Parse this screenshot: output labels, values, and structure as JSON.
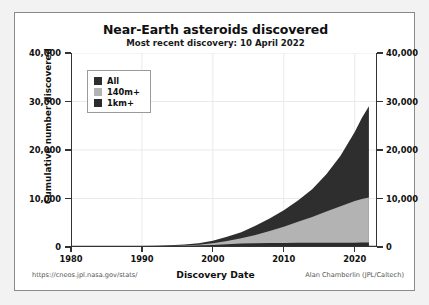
{
  "chart_data": {
    "type": "area",
    "title": "Near-Earth asteroids discovered",
    "subtitle": "Most recent discovery:  10 April 2022",
    "xlabel": "Discovery Date",
    "ylabel": "Cumulative number discovered",
    "xlim": [
      1980,
      2023
    ],
    "ylim": [
      0,
      40000
    ],
    "xticks": [
      "1980",
      "1990",
      "2000",
      "2010",
      "2020"
    ],
    "xtick_values": [
      1980,
      1990,
      2000,
      2010,
      2020
    ],
    "yticks": [
      "0",
      "10,000",
      "20,000",
      "30,000",
      "40,000"
    ],
    "ytick_values": [
      0,
      10000,
      20000,
      30000,
      40000
    ],
    "grid": true,
    "stacked": true,
    "legend_position": "upper left",
    "x": [
      1980,
      1982,
      1984,
      1986,
      1988,
      1990,
      1992,
      1994,
      1996,
      1998,
      2000,
      2002,
      2004,
      2006,
      2008,
      2010,
      2012,
      2014,
      2016,
      2018,
      2020,
      2021,
      2022
    ],
    "series": [
      {
        "name": "All",
        "color": "#2e2e2e",
        "values": [
          60,
          75,
          95,
          120,
          160,
          210,
          280,
          380,
          530,
          780,
          1300,
          2100,
          3050,
          4400,
          5900,
          7600,
          9600,
          11900,
          15000,
          18800,
          23700,
          26600,
          29000
        ]
      },
      {
        "name": "140m+",
        "color": "#b3b3b3",
        "values": [
          40,
          50,
          62,
          78,
          100,
          128,
          168,
          225,
          310,
          450,
          760,
          1250,
          1800,
          2500,
          3300,
          4200,
          5200,
          6200,
          7300,
          8400,
          9500,
          9900,
          10200
        ]
      },
      {
        "name": "1km+",
        "color": "#2b2b2b",
        "values": [
          25,
          32,
          40,
          50,
          65,
          85,
          110,
          148,
          200,
          290,
          430,
          590,
          700,
          770,
          810,
          840,
          860,
          875,
          885,
          895,
          900,
          905,
          910
        ]
      }
    ]
  },
  "footer": {
    "source_url": "https://cneos.jpl.nasa.gov/stats/",
    "credit": "Alan Chamberlin (JPL/Caltech)"
  }
}
